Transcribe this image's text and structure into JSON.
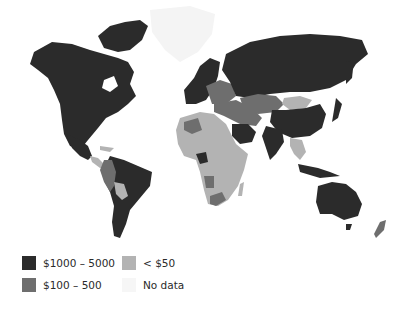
{
  "title": "",
  "legend": {
    "items": [
      {
        "label": "$1000 – 5000",
        "color": "#2b2b2b"
      },
      {
        "label": "$100 –  500",
        "color": "#6e6e6e"
      },
      {
        "label": "< $50",
        "color": "#b3b3b3"
      },
      {
        "label": "No data",
        "color": "#f6f6f6"
      }
    ]
  },
  "colors": {
    "high": "#2b2b2b",
    "mid": "#6e6e6e",
    "low": "#b3b3b3",
    "nodata": "#f6f6f6",
    "background": "#ffffff"
  },
  "regions": [
    {
      "name": "North America",
      "class": "$1000 – 5000"
    },
    {
      "name": "Greenland",
      "class": "No data"
    },
    {
      "name": "Central America",
      "class": "< $50"
    },
    {
      "name": "Brazil / Argentina",
      "class": "$1000 – 5000"
    },
    {
      "name": "Andean countries",
      "class": "$100 –  500"
    },
    {
      "name": "Western Europe",
      "class": "$1000 – 5000"
    },
    {
      "name": "Eastern Europe",
      "class": "$100 –  500"
    },
    {
      "name": "Russia",
      "class": "$1000 – 5000"
    },
    {
      "name": "Central Asia",
      "class": "$100 –  500"
    },
    {
      "name": "Mongolia",
      "class": "< $50"
    },
    {
      "name": "China",
      "class": "$1000 – 5000"
    },
    {
      "name": "India",
      "class": "$1000 – 5000"
    },
    {
      "name": "Middle East",
      "class": "$100 –  500"
    },
    {
      "name": "Saudi Arabia",
      "class": "$1000 – 5000"
    },
    {
      "name": "Africa",
      "class": "< $50"
    },
    {
      "name": "Nigeria",
      "class": "$1000 – 5000"
    },
    {
      "name": "South Africa",
      "class": "$100 –  500"
    },
    {
      "name": "Southeast Asia",
      "class": "< $50"
    },
    {
      "name": "Australia",
      "class": "$1000 – 5000"
    },
    {
      "name": "New Zealand",
      "class": "$100 –  500"
    }
  ]
}
